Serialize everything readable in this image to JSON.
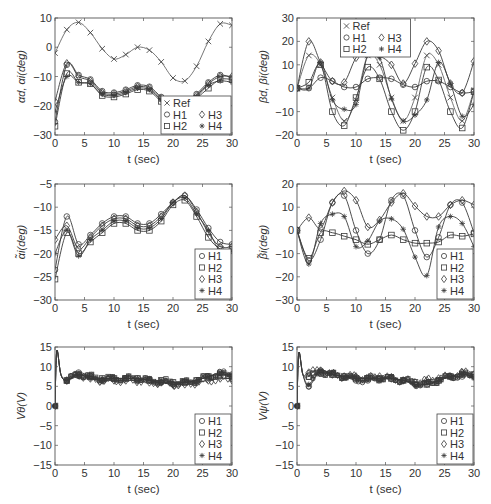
{
  "figure": {
    "layout": "3 rows x 2 columns of line plots",
    "line_color": "#3a3a3a",
    "ref_line_color": "#666666",
    "axis_color": "#555555"
  },
  "legend_markers": {
    "Ref": "x",
    "H1": "circle",
    "H2": "square",
    "H3": "diamond",
    "H4": "asterisk"
  },
  "chart_data": [
    {
      "id": "alpha",
      "type": "line",
      "title": "",
      "xlabel": "t (sec)",
      "ylabel": "αd, αi(deg)",
      "xlim": [
        0,
        30
      ],
      "ylim": [
        -30,
        10
      ],
      "xticks": [
        0,
        5,
        10,
        15,
        20,
        25,
        30
      ],
      "yticks": [
        -30,
        -20,
        -10,
        0,
        10
      ],
      "grid": false,
      "frame": {
        "left": 55,
        "top": 18,
        "right": 232,
        "bottom": 135
      },
      "legend": {
        "position": "lower right",
        "layout": "ref-row + 2x2",
        "entries": [
          "Ref",
          "H1",
          "H2",
          "H3",
          "H4"
        ]
      },
      "x": [
        0,
        2,
        4,
        6,
        8,
        10,
        12,
        14,
        16,
        18,
        20,
        22,
        24,
        26,
        28,
        30
      ],
      "series": [
        {
          "name": "Ref",
          "marker": "x",
          "values": [
            -2,
            6,
            8.5,
            5,
            -0.5,
            -4,
            -2.5,
            0,
            -1,
            -5,
            -10.5,
            -11.5,
            -6.5,
            2,
            8,
            7.5
          ]
        },
        {
          "name": "H1",
          "marker": "circle",
          "values": [
            -25.5,
            -6,
            -9.5,
            -11,
            -15,
            -15.5,
            -14.5,
            -13,
            -13.5,
            -17,
            -20,
            -20,
            -16,
            -12,
            -9.5,
            -10.5
          ]
        },
        {
          "name": "H2",
          "marker": "square",
          "values": [
            -27,
            -9,
            -12,
            -12.5,
            -16.5,
            -17,
            -16,
            -14.5,
            -15,
            -18.5,
            -21,
            -21,
            -17.5,
            -14,
            -11,
            -11
          ]
        },
        {
          "name": "H3",
          "marker": "diamond",
          "values": [
            -18.5,
            -5.5,
            -10,
            -11.5,
            -15.5,
            -16,
            -15,
            -13.5,
            -14,
            -17.5,
            -20.5,
            -20.5,
            -16.5,
            -12.5,
            -10,
            -10
          ]
        },
        {
          "name": "H4",
          "marker": "asterisk",
          "values": [
            -22,
            -10,
            -12,
            -12.5,
            -16,
            -16.5,
            -15.5,
            -14,
            -14.5,
            -18,
            -20.5,
            -20.5,
            -17,
            -13,
            -11.5,
            -12
          ]
        }
      ]
    },
    {
      "id": "beta",
      "type": "line",
      "title": "",
      "xlabel": "t (sec)",
      "ylabel": "βd, βi(deg)",
      "xlim": [
        0,
        30
      ],
      "ylim": [
        -20,
        30
      ],
      "xticks": [
        0,
        5,
        10,
        15,
        20,
        25,
        30
      ],
      "yticks": [
        -20,
        -10,
        0,
        10,
        20,
        30
      ],
      "grid": false,
      "frame": {
        "left": 297,
        "top": 18,
        "right": 474,
        "bottom": 135
      },
      "legend": {
        "position": "upper center",
        "layout": "ref-row + 2x2",
        "entries": [
          "Ref",
          "H1",
          "H2",
          "H3",
          "H4"
        ]
      },
      "x": [
        0,
        2,
        4,
        6,
        8,
        10,
        12,
        14,
        16,
        18,
        20,
        22,
        24,
        26,
        28,
        30
      ],
      "series": [
        {
          "name": "Ref",
          "marker": "x",
          "values": [
            0,
            14,
            10,
            -4,
            -14,
            -5,
            14,
            10,
            -4,
            -14,
            -4,
            14,
            10,
            -4,
            -14,
            -1
          ]
        },
        {
          "name": "H1",
          "marker": "circle",
          "values": [
            0,
            0,
            4.5,
            3,
            0.5,
            0.5,
            4,
            4.5,
            4,
            1.5,
            0.5,
            3,
            3,
            0.5,
            -2,
            -1.5
          ]
        },
        {
          "name": "H2",
          "marker": "square",
          "values": [
            0,
            2.5,
            10,
            -10,
            -16,
            -4,
            9,
            4,
            -10,
            -18,
            -10,
            9,
            3.5,
            -10,
            -17,
            -1.5
          ]
        },
        {
          "name": "H3",
          "marker": "diamond",
          "values": [
            0,
            20,
            11,
            3,
            2.5,
            13,
            17,
            14,
            10,
            2,
            10.5,
            20,
            16,
            2,
            -2,
            11.5
          ]
        },
        {
          "name": "H4",
          "marker": "asterisk",
          "values": [
            0,
            0,
            11,
            -5,
            -9,
            -7,
            14,
            13,
            -4.5,
            -14,
            -11.5,
            -5,
            11,
            2,
            -12,
            -7
          ]
        }
      ]
    },
    {
      "id": "alpha-tilde",
      "type": "line",
      "title": "",
      "xlabel": "t (sec)",
      "ylabel": "α̃i(deg)",
      "xlim": [
        0,
        30
      ],
      "ylim": [
        -30,
        -5
      ],
      "xticks": [
        0,
        5,
        10,
        15,
        20,
        25,
        30
      ],
      "yticks": [
        -30,
        -25,
        -20,
        -15,
        -10,
        -5
      ],
      "grid": false,
      "frame": {
        "left": 55,
        "top": 184,
        "right": 232,
        "bottom": 300
      },
      "legend": {
        "position": "lower right",
        "layout": "single column",
        "entries": [
          "H1",
          "H2",
          "H3",
          "H4"
        ]
      },
      "x": [
        0,
        2,
        4,
        6,
        8,
        10,
        12,
        14,
        16,
        18,
        20,
        22,
        24,
        26,
        28,
        30
      ],
      "series": [
        {
          "name": "H1",
          "marker": "circle",
          "values": [
            -23.5,
            -12,
            -18,
            -16,
            -13.5,
            -12,
            -12,
            -13.5,
            -13.5,
            -11.5,
            -9,
            -7.5,
            -10.5,
            -14.5,
            -17.5,
            -18
          ]
        },
        {
          "name": "H2",
          "marker": "square",
          "values": [
            -25.5,
            -15.5,
            -20,
            -17.5,
            -15.5,
            -13.5,
            -13.5,
            -15,
            -15,
            -13,
            -9.5,
            -8.5,
            -12,
            -16.5,
            -19,
            -19
          ]
        },
        {
          "name": "H3",
          "marker": "diamond",
          "values": [
            -17,
            -14,
            -19,
            -16.5,
            -14,
            -12.5,
            -12.5,
            -14,
            -14,
            -12,
            -9,
            -7.5,
            -11,
            -15.5,
            -18.5,
            -18.5
          ]
        },
        {
          "name": "H4",
          "marker": "asterisk",
          "values": [
            -20,
            -15,
            -20.5,
            -17,
            -15,
            -13,
            -13,
            -14.5,
            -14.5,
            -12.5,
            -9,
            -8,
            -11.5,
            -15,
            -19.5,
            -19.5
          ]
        }
      ]
    },
    {
      "id": "beta-tilde",
      "type": "line",
      "title": "",
      "xlabel": "t (sec)",
      "ylabel": "β̃i(deg)",
      "xlim": [
        0,
        30
      ],
      "ylim": [
        -30,
        20
      ],
      "xticks": [
        0,
        5,
        10,
        15,
        20,
        25,
        30
      ],
      "yticks": [
        -30,
        -20,
        -10,
        0,
        10,
        20
      ],
      "grid": false,
      "frame": {
        "left": 297,
        "top": 184,
        "right": 474,
        "bottom": 300
      },
      "legend": {
        "position": "lower right",
        "layout": "single column",
        "entries": [
          "H1",
          "H2",
          "H3",
          "H4"
        ]
      },
      "x": [
        0,
        2,
        4,
        6,
        8,
        10,
        12,
        14,
        16,
        18,
        20,
        22,
        24,
        26,
        28,
        30
      ],
      "series": [
        {
          "name": "H1",
          "marker": "circle",
          "values": [
            0,
            -13,
            -4,
            12,
            15,
            0,
            -10,
            -4,
            13,
            15,
            0,
            -11.5,
            -3,
            11,
            12,
            -1
          ]
        },
        {
          "name": "H2",
          "marker": "square",
          "values": [
            0,
            -12,
            -1,
            -1,
            -2.5,
            -4,
            -6,
            -4,
            -2,
            -4,
            -5.5,
            -5.5,
            -5,
            -2,
            -2.5,
            -1.5
          ]
        },
        {
          "name": "H3",
          "marker": "diamond",
          "values": [
            0,
            5.5,
            1,
            12,
            17,
            13,
            1.5,
            4.5,
            12,
            16,
            10.5,
            6,
            6,
            11,
            13,
            11
          ]
        },
        {
          "name": "H4",
          "marker": "asterisk",
          "values": [
            0,
            -14.5,
            3,
            7,
            6,
            -7,
            -4.5,
            4,
            5,
            0.5,
            -11.5,
            -19.5,
            1.5,
            6,
            3,
            -7
          ]
        }
      ]
    },
    {
      "id": "v-theta",
      "type": "line",
      "title": "",
      "xlabel": "t (sec)",
      "ylabel": "Vθ(V)",
      "xlim": [
        0,
        30
      ],
      "ylim": [
        -15,
        15
      ],
      "xticks": [
        0,
        5,
        10,
        15,
        20,
        25,
        30
      ],
      "yticks": [
        -15,
        -10,
        -5,
        0,
        5,
        10,
        15
      ],
      "grid": false,
      "frame": {
        "left": 55,
        "top": 347,
        "right": 232,
        "bottom": 465
      },
      "legend": {
        "position": "lower right",
        "layout": "single column",
        "entries": [
          "H1",
          "H2",
          "H3",
          "H4"
        ]
      },
      "x": [
        0,
        0.3,
        1,
        2,
        4,
        6,
        8,
        10,
        12,
        14,
        16,
        18,
        20,
        22,
        24,
        26,
        28,
        30
      ],
      "series": [
        {
          "name": "H1",
          "marker": "circle",
          "values": [
            0,
            14,
            8,
            6.5,
            8.5,
            7.5,
            6.5,
            7,
            7,
            7,
            6.5,
            6,
            5.5,
            6,
            6.5,
            7.5,
            8.5,
            8
          ]
        },
        {
          "name": "H2",
          "marker": "square",
          "values": [
            0,
            14,
            8,
            6.5,
            8,
            7.5,
            7,
            7,
            7,
            7,
            6.5,
            6.5,
            6,
            6,
            6.5,
            7.5,
            8,
            7.5
          ]
        },
        {
          "name": "H3",
          "marker": "diamond",
          "values": [
            0,
            14,
            8,
            6.5,
            8,
            7,
            6.5,
            6.5,
            6.5,
            6.5,
            6,
            6,
            5.5,
            5.5,
            6,
            6.5,
            7,
            7
          ]
        },
        {
          "name": "H4",
          "marker": "asterisk",
          "values": [
            0,
            14,
            8,
            6.5,
            8,
            7,
            7,
            7,
            7,
            7,
            6.5,
            6,
            6,
            6,
            6.5,
            7.5,
            8,
            8
          ]
        }
      ]
    },
    {
      "id": "v-psi",
      "type": "line",
      "title": "",
      "xlabel": "t (sec)",
      "ylabel": "Vψ(V)",
      "xlim": [
        0,
        30
      ],
      "ylim": [
        -15,
        15
      ],
      "xticks": [
        0,
        5,
        10,
        15,
        20,
        25,
        30
      ],
      "yticks": [
        -15,
        -10,
        -5,
        0,
        5,
        10,
        15
      ],
      "grid": false,
      "frame": {
        "left": 297,
        "top": 347,
        "right": 474,
        "bottom": 465
      },
      "legend": {
        "position": "lower right",
        "layout": "single column",
        "entries": [
          "H1",
          "H2",
          "H3",
          "H4"
        ]
      },
      "x": [
        0,
        0.3,
        1,
        2,
        4,
        6,
        8,
        10,
        12,
        14,
        16,
        18,
        20,
        22,
        24,
        26,
        28,
        30
      ],
      "series": [
        {
          "name": "H1",
          "marker": "circle",
          "values": [
            0,
            13.5,
            8,
            5,
            9,
            8,
            7.5,
            6.5,
            6.5,
            7,
            7,
            6.5,
            5.5,
            5.5,
            6.5,
            7.5,
            7.5,
            8
          ]
        },
        {
          "name": "H2",
          "marker": "square",
          "values": [
            0,
            13.5,
            8,
            7.5,
            8.5,
            8,
            7.5,
            7,
            7,
            7,
            7,
            6.5,
            6,
            5.5,
            6.5,
            7.5,
            8,
            8
          ]
        },
        {
          "name": "H3",
          "marker": "diamond",
          "values": [
            0,
            13.5,
            8,
            8.5,
            9,
            8,
            7.5,
            7.5,
            7,
            7.5,
            7,
            6.5,
            6,
            6.5,
            7,
            7.5,
            8.5,
            8
          ]
        },
        {
          "name": "H4",
          "marker": "asterisk",
          "values": [
            0,
            13.5,
            8,
            5.5,
            9,
            8,
            7.5,
            7,
            7,
            7,
            7,
            6.5,
            5.5,
            5.5,
            6.5,
            7.5,
            8,
            7.5
          ]
        }
      ]
    }
  ]
}
